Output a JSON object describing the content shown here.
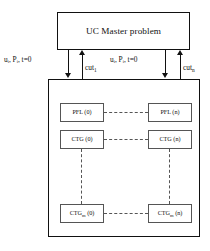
{
  "diagram": {
    "type": "benders-decomposition-flow",
    "master": {
      "label": "UC Master problem"
    },
    "arrows": {
      "left": {
        "down_label_main": "u",
        "down_label": "uᵢ, Pᵢ, t=0",
        "up_label_base": "cut",
        "up_label_sub": "1"
      },
      "right": {
        "down_label": "uᵢ, Pᵢ, t=0",
        "up_label_base": "cut",
        "up_label_sub": "n"
      }
    },
    "subproblem_grid": {
      "rows": [
        {
          "name": "pfl-row",
          "left": {
            "base": "PFL (0)",
            "sub": ""
          },
          "right": {
            "base": "PFL (n)",
            "sub": ""
          }
        },
        {
          "name": "ctg-row",
          "left": {
            "base": "CTG (0)",
            "sub": ""
          },
          "right": {
            "base": "CTG (n)",
            "sub": ""
          }
        },
        {
          "name": "ctgm-row",
          "left": {
            "base_pre": "CTG",
            "sub": "m",
            "base_post": " (0)"
          },
          "right": {
            "base_pre": "CTG",
            "sub": "m",
            "base_post": " (n)"
          }
        }
      ]
    },
    "colors": {
      "stroke": "#111111",
      "node_stroke": "#555555",
      "background": "#ffffff"
    }
  }
}
